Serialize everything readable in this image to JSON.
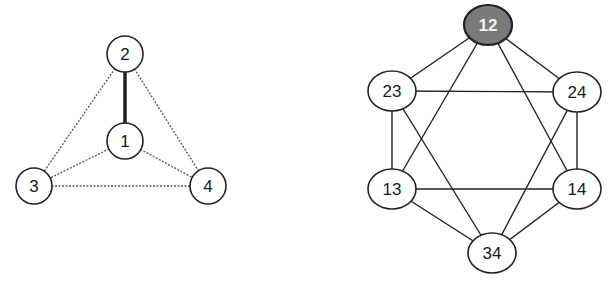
{
  "left_graph": {
    "nodes": [
      {
        "id": "1",
        "label": "1",
        "x": 125,
        "y": 141
      },
      {
        "id": "2",
        "label": "2",
        "x": 125,
        "y": 54
      },
      {
        "id": "3",
        "label": "3",
        "x": 34,
        "y": 186
      },
      {
        "id": "4",
        "label": "4",
        "x": 208,
        "y": 186
      }
    ],
    "edges": [
      {
        "from": "1",
        "to": "2",
        "style": "thick"
      },
      {
        "from": "2",
        "to": "3",
        "style": "dotted"
      },
      {
        "from": "2",
        "to": "4",
        "style": "dotted"
      },
      {
        "from": "1",
        "to": "3",
        "style": "dotted"
      },
      {
        "from": "1",
        "to": "4",
        "style": "dotted"
      },
      {
        "from": "3",
        "to": "4",
        "style": "dotted"
      }
    ],
    "node_radius": 18
  },
  "right_graph": {
    "nodes": [
      {
        "id": "12",
        "label": "12",
        "x": 488,
        "y": 25,
        "highlight": true
      },
      {
        "id": "23",
        "label": "23",
        "x": 392,
        "y": 91
      },
      {
        "id": "24",
        "label": "24",
        "x": 577,
        "y": 92
      },
      {
        "id": "13",
        "label": "13",
        "x": 392,
        "y": 189
      },
      {
        "id": "14",
        "label": "14",
        "x": 577,
        "y": 189
      },
      {
        "id": "34",
        "label": "34",
        "x": 492,
        "y": 253
      }
    ],
    "edges": [
      [
        "12",
        "23"
      ],
      [
        "12",
        "24"
      ],
      [
        "12",
        "13"
      ],
      [
        "12",
        "14"
      ],
      [
        "23",
        "24"
      ],
      [
        "23",
        "13"
      ],
      [
        "23",
        "34"
      ],
      [
        "24",
        "14"
      ],
      [
        "24",
        "34"
      ],
      [
        "13",
        "14"
      ],
      [
        "13",
        "34"
      ],
      [
        "14",
        "34"
      ]
    ],
    "node_rx": 24,
    "node_ry": 20
  },
  "colors": {
    "stroke": "#222222",
    "dotted_edge": "#555555",
    "node_fill": "#ffffff",
    "highlight_fill": "#7a7a7a",
    "highlight_text": "#f2f2f2"
  }
}
